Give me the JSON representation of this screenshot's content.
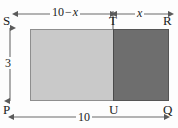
{
  "figure": {
    "vertices": [
      {
        "id": "S",
        "label": "S",
        "position": "top-left"
      },
      {
        "id": "T",
        "label": "T",
        "position": "top-middle"
      },
      {
        "id": "R",
        "label": "R",
        "position": "top-right"
      },
      {
        "id": "P",
        "label": "P",
        "position": "bottom-left"
      },
      {
        "id": "U",
        "label": "U",
        "position": "bottom-middle"
      },
      {
        "id": "Q",
        "label": "Q",
        "position": "bottom-right"
      }
    ],
    "regions": [
      {
        "id": "PSTU",
        "fill": "#c9c9c9",
        "shade": "light-gray"
      },
      {
        "id": "TRQU",
        "fill": "#6e6e6e",
        "shade": "dark-gray"
      }
    ],
    "dimensions": {
      "top_left": {
        "value": "10 − x",
        "number": "10",
        "minus": "−",
        "variable": "x",
        "from": "S",
        "to": "T"
      },
      "top_right": {
        "value": "x",
        "variable": "x",
        "from": "T",
        "to": "R"
      },
      "bottom": {
        "value": "10",
        "from": "P",
        "to": "Q"
      },
      "left": {
        "value": "3",
        "from": "P",
        "to": "S"
      }
    },
    "colors": {
      "light_region": "#c9c9c9",
      "dark_region": "#6e6e6e",
      "outline": "#8e8e8e",
      "dimension_line": "#6b6b6b",
      "text": "#1b1b1b",
      "background": "#fdfdfd"
    }
  }
}
